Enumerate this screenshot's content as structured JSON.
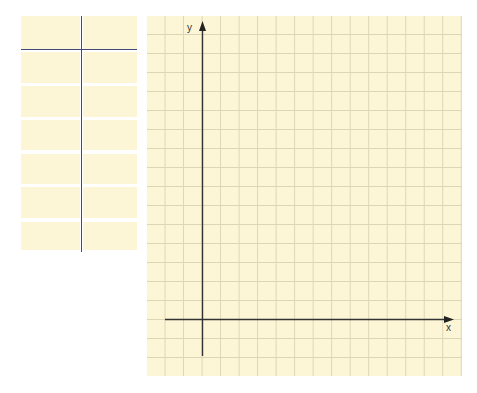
{
  "table": {
    "columns": [
      "",
      ""
    ],
    "rows": [
      [
        "",
        ""
      ],
      [
        "",
        ""
      ],
      [
        "",
        ""
      ],
      [
        "",
        ""
      ],
      [
        "",
        ""
      ],
      [
        "",
        ""
      ]
    ],
    "cell_color": "#fdf6d6",
    "divider_color": "#3f4a78"
  },
  "grid": {
    "columns": 17,
    "rows": 19,
    "background_color": "#fdf6d6",
    "line_color": "#ddd6b4",
    "x_axis_label": "x",
    "y_axis_label": "y",
    "axis_color": "#333333"
  }
}
